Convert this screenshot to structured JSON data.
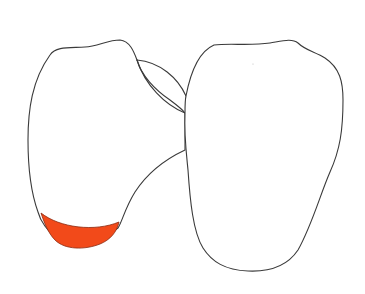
{
  "diagram": {
    "canvas": {
      "width": 365,
      "height": 294,
      "background": "#ffffff"
    },
    "line_color": "#3a3a3a",
    "shapes": [
      {
        "id": "left-lobe",
        "fill": "#ffffff"
      },
      {
        "id": "connector-lens",
        "fill": "#ffffff"
      },
      {
        "id": "right-lobe",
        "fill": "#ffffff"
      },
      {
        "id": "highlighted-region",
        "fill": "#f24a1a",
        "position": "bottom of left lobe"
      }
    ],
    "labels": []
  }
}
